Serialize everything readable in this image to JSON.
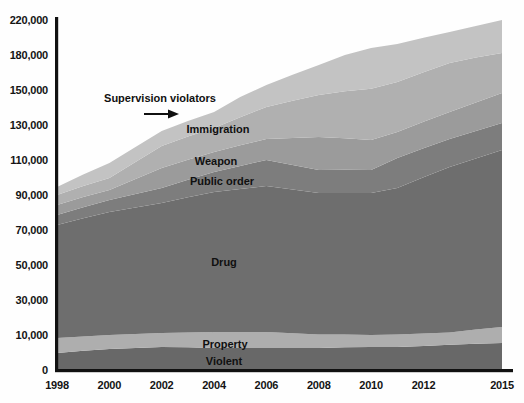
{
  "figure": {
    "kind": "stacked area chart, grayscale print style",
    "background": "#fefefe",
    "axis_color": "#111111"
  },
  "chart_data": {
    "type": "area",
    "stacked": true,
    "title": "",
    "xlabel": "",
    "ylabel": "",
    "grid": false,
    "legend": "labels drawn inside bands",
    "x": [
      1998,
      1999,
      2000,
      2001,
      2002,
      2003,
      2004,
      2005,
      2006,
      2007,
      2008,
      2009,
      2010,
      2011,
      2012,
      2013,
      2014,
      2015
    ],
    "x_axis": {
      "tick_years": [
        1998,
        2000,
        2002,
        2004,
        2006,
        2008,
        2010,
        2012,
        2015
      ]
    },
    "y_axis": {
      "note": "non-uniform value steps at uniform spacing, as printed",
      "tick_values": [
        0,
        10000,
        30000,
        50000,
        70000,
        90000,
        110000,
        130000,
        150000,
        180000,
        220000
      ],
      "tick_labels": [
        "0",
        "10,000",
        "30,000",
        "50,000",
        "70,000",
        "90,000",
        "110,000",
        "130,000",
        "150,000",
        "180,000",
        "220,000"
      ]
    },
    "series": [
      {
        "name": "Violent",
        "color": "#686868",
        "values": [
          4900,
          5500,
          6000,
          6300,
          6600,
          6500,
          6300,
          6300,
          6300,
          6300,
          6300,
          6500,
          6600,
          6600,
          6900,
          7200,
          7500,
          7700
        ]
      },
      {
        "name": "Property",
        "color": "#aeaeae",
        "values": [
          4200,
          4100,
          4000,
          4300,
          4500,
          5000,
          5400,
          5400,
          5400,
          4700,
          4000,
          3700,
          3400,
          3600,
          4000,
          4300,
          5600,
          6900
        ]
      },
      {
        "name": "Drug",
        "color": "#6e6e6e",
        "values": [
          63800,
          67100,
          70300,
          72300,
          74300,
          77200,
          80000,
          81700,
          83400,
          82100,
          80800,
          81000,
          81100,
          83800,
          89200,
          94500,
          97800,
          101100
        ]
      },
      {
        "name": "Public order",
        "color": "#7d7d7d",
        "values": [
          5700,
          6300,
          6800,
          7700,
          8600,
          10000,
          11400,
          13200,
          14900,
          14100,
          13200,
          13200,
          13200,
          17100,
          16600,
          16000,
          15700,
          15400
        ]
      },
      {
        "name": "Weapon",
        "color": "#9b9b9b",
        "values": [
          5700,
          5800,
          5800,
          8600,
          11400,
          11500,
          11500,
          11800,
          12000,
          15400,
          18800,
          18000,
          17100,
          14900,
          15200,
          15400,
          16300,
          17200
        ]
      },
      {
        "name": "Immigration",
        "color": "#b0b0b0",
        "values": [
          5700,
          6300,
          6800,
          9700,
          12600,
          13200,
          13700,
          16000,
          18300,
          21200,
          24000,
          26900,
          29700,
          30900,
          33300,
          35700,
          34900,
          34000
        ]
      },
      {
        "name": "Supervision violators",
        "color": "#c3c3c3",
        "values": [
          4600,
          6600,
          8600,
          8600,
          8600,
          8900,
          9100,
          11600,
          14000,
          19200,
          24300,
          30600,
          36900,
          35700,
          34500,
          33200,
          35500,
          37700
        ]
      }
    ],
    "annotations": {
      "supervision": "Supervision violators",
      "immigration": "Immigration",
      "weapon": "Weapon",
      "public_order": "Public order",
      "drug": "Drug",
      "property": "Property",
      "violent": "Violent"
    }
  }
}
